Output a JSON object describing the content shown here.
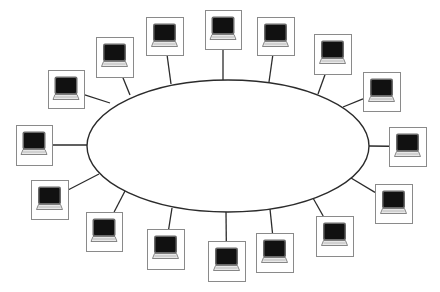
{
  "diagram": {
    "topology": "ring",
    "ring": {
      "cx": 228,
      "cy": 146,
      "rx": 141,
      "ry": 66
    },
    "node_icon": "laptop-icon",
    "colors": {
      "background": "#ffffff",
      "ring_stroke": "#2b2b2b",
      "box_border": "#8a8a8a",
      "screen": "#111111",
      "keyboard": "#e8e8e8"
    },
    "nodes": [
      {
        "id": 1,
        "box": [
          48,
          70,
          36,
          38
        ],
        "attach": [
          110,
          103
        ]
      },
      {
        "id": 2,
        "box": [
          96,
          37,
          37,
          40
        ],
        "attach": [
          130,
          95
        ]
      },
      {
        "id": 3,
        "box": [
          146,
          17,
          37,
          38
        ],
        "attach": [
          171,
          84
        ]
      },
      {
        "id": 4,
        "box": [
          205,
          10,
          36,
          39
        ],
        "attach": [
          223,
          80
        ]
      },
      {
        "id": 5,
        "box": [
          257,
          17,
          37,
          38
        ],
        "attach": [
          269,
          82
        ]
      },
      {
        "id": 6,
        "box": [
          314,
          34,
          37,
          40
        ],
        "attach": [
          318,
          94
        ]
      },
      {
        "id": 7,
        "box": [
          363,
          72,
          37,
          39
        ],
        "attach": [
          343,
          107
        ]
      },
      {
        "id": 8,
        "box": [
          389,
          127,
          37,
          39
        ],
        "attach": [
          369,
          146
        ]
      },
      {
        "id": 9,
        "box": [
          375,
          184,
          37,
          39
        ],
        "attach": [
          351,
          178
        ]
      },
      {
        "id": 10,
        "box": [
          316,
          216,
          37,
          40
        ],
        "attach": [
          313,
          198
        ]
      },
      {
        "id": 11,
        "box": [
          256,
          233,
          37,
          39
        ],
        "attach": [
          270,
          209
        ]
      },
      {
        "id": 12,
        "box": [
          208,
          241,
          37,
          40
        ],
        "attach": [
          226,
          212
        ]
      },
      {
        "id": 13,
        "box": [
          147,
          229,
          37,
          40
        ],
        "attach": [
          172,
          208
        ]
      },
      {
        "id": 14,
        "box": [
          86,
          212,
          36,
          39
        ],
        "attach": [
          125,
          191
        ]
      },
      {
        "id": 15,
        "box": [
          31,
          180,
          37,
          39
        ],
        "attach": [
          99,
          174
        ]
      },
      {
        "id": 16,
        "box": [
          16,
          125,
          36,
          40
        ],
        "attach": [
          87,
          145
        ]
      }
    ]
  }
}
